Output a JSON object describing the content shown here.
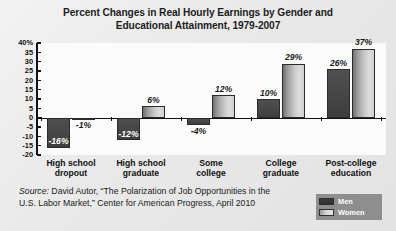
{
  "chart_data": {
    "type": "bar",
    "title": "Percent Changes in Real Hourly Earnings by Gender and Educational Attainment, 1979-2007",
    "title_line1": "Percent Changes in Real Hourly Earnings by Gender and",
    "title_line2": "Educational Attainment, 1979-2007",
    "xlabel": "",
    "ylabel": "",
    "ylim": [
      -20,
      40
    ],
    "ytick_values": [
      40,
      35,
      30,
      25,
      20,
      15,
      10,
      5,
      0,
      -5,
      -10,
      -15,
      -20
    ],
    "ytick_labels": [
      "40%",
      "35",
      "30",
      "25",
      "20",
      "15",
      "10",
      "5",
      "0",
      "-5",
      "-10",
      "-15",
      "-20"
    ],
    "grid": false,
    "legend_position": "bottom-right",
    "categories": [
      "High school dropout",
      "High school graduate",
      "Some college",
      "College graduate",
      "Post-college education"
    ],
    "category_lines": [
      [
        "High school",
        "dropout"
      ],
      [
        "High school",
        "graduate"
      ],
      [
        "Some",
        "college"
      ],
      [
        "College",
        "graduate"
      ],
      [
        "Post-college",
        "education"
      ]
    ],
    "series": [
      {
        "name": "Men",
        "color": "#464646",
        "values": [
          -16,
          -12,
          -4,
          10,
          26
        ],
        "labels": [
          "-16%",
          "-12%",
          "-4%",
          "10%",
          "26%"
        ]
      },
      {
        "name": "Women",
        "color": "#cfcfcf",
        "values": [
          -1,
          6,
          12,
          29,
          37
        ],
        "labels": [
          "-1%",
          "6%",
          "12%",
          "29%",
          "37%"
        ]
      }
    ]
  },
  "source": {
    "label": "Source:",
    "line1_rest": " David Autor, “The Polarization of Job Opportunities in the",
    "line2": "U.S. Labor Market,” Center for American Progress, April 2010"
  },
  "legend": {
    "items": [
      {
        "name": "Men"
      },
      {
        "name": "Women"
      }
    ]
  }
}
